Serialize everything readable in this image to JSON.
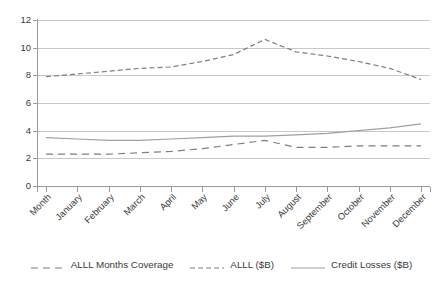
{
  "chart_data": {
    "type": "line",
    "title": "",
    "xlabel": "",
    "ylabel": "",
    "ylim": [
      0,
      12
    ],
    "ytick_step": 2,
    "yticks": [
      "0",
      "2",
      "4",
      "6",
      "8",
      "10",
      "12"
    ],
    "grid": true,
    "legend_position": "bottom",
    "categories": [
      "Month",
      "January",
      "February",
      "March",
      "April",
      "May",
      "June",
      "July",
      "August",
      "September",
      "October",
      "November",
      "December"
    ],
    "series": [
      {
        "name": "ALLL Months Coverage",
        "style": "long-dash",
        "color": "#7f7f7f",
        "values": [
          2.3,
          2.3,
          2.3,
          2.4,
          2.5,
          2.7,
          3.0,
          3.3,
          2.8,
          2.8,
          2.9,
          2.9,
          2.9
        ]
      },
      {
        "name": "ALLL ($B)",
        "style": "short-dash",
        "color": "#7f7f7f",
        "values": [
          7.9,
          8.1,
          8.3,
          8.5,
          8.6,
          9.0,
          9.5,
          10.6,
          9.7,
          9.4,
          9.0,
          8.5,
          7.7
        ]
      },
      {
        "name": "Credit Losses ($B)",
        "style": "solid",
        "color": "#a0a0a0",
        "values": [
          3.5,
          3.4,
          3.3,
          3.3,
          3.4,
          3.5,
          3.6,
          3.6,
          3.7,
          3.8,
          4.0,
          4.2,
          4.5
        ]
      }
    ]
  },
  "colors": {
    "background": "#ffffff",
    "gridline": "#c9c9c9",
    "axis": "#9a9a9a",
    "text": "#3a3a3a"
  },
  "legend": {
    "items": [
      {
        "label": "ALLL Months Coverage"
      },
      {
        "label": "ALLL ($B)"
      },
      {
        "label": "Credit Losses ($B)"
      }
    ]
  }
}
